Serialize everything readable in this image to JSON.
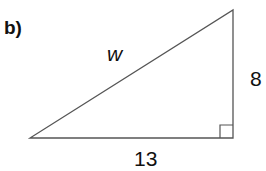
{
  "problem": {
    "part_label": "b)",
    "hypotenuse_label": "w",
    "vertical_side_label": "8",
    "horizontal_side_label": "13",
    "right_angle_marker": "square"
  },
  "colors": {
    "stroke": "#555555",
    "text": "#111111"
  }
}
